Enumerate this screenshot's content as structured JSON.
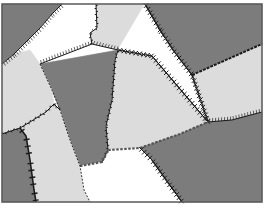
{
  "figure": {
    "title": "",
    "colors": {
      "dark": "#7c7c7c",
      "light": "#dcdcdc",
      "white": "#ffffff",
      "frame": "#5a5a5a",
      "boundary": "#1a1a1a"
    },
    "regions": [
      {
        "id": "r1",
        "shade": "dark",
        "points": "2,4 62,4 52,14 40,28 28,40 14,54 2,64"
      },
      {
        "id": "r2",
        "shade": "white",
        "points": "62,4 96,4 97,28 90,33 92,44 40,64 30,50 14,54 28,40 40,28 52,14"
      },
      {
        "id": "r3",
        "shade": "light",
        "points": "96,4 145,4 118,50 92,44 90,33 97,28"
      },
      {
        "id": "r4",
        "shade": "dark",
        "points": "145,4 262,4 262,44 192,75 173,50 160,30"
      },
      {
        "id": "r5",
        "shade": "white",
        "points": "145,4 160,30 173,50 192,75 208,122 152,56 118,50"
      },
      {
        "id": "r6",
        "shade": "light",
        "points": "262,44 262,112 232,120 208,122 192,75"
      },
      {
        "id": "r7",
        "shade": "dark",
        "points": "40,64 118,50 115,60 112,100 106,126 108,150 102,162 80,166 70,140 60,110 52,90"
      },
      {
        "id": "r8",
        "shade": "light",
        "points": "118,50 152,56 208,122 180,134 140,148 108,150 106,126 112,100 115,60"
      },
      {
        "id": "r9",
        "shade": "light",
        "points": "2,64 14,54 30,50 40,64 52,90 54,104 46,112 30,122 20,128 2,134"
      },
      {
        "id": "r10",
        "shade": "dark",
        "points": "2,134 20,128 26,136 30,160 34,190 36,202 2,202"
      },
      {
        "id": "r11",
        "shade": "light",
        "points": "20,128 30,122 46,112 54,104 60,110 70,140 80,166 84,190 90,202 36,202 34,190 30,160 26,136"
      },
      {
        "id": "r12",
        "shade": "white",
        "points": "80,166 102,162 108,150 140,148 152,160 166,180 182,202 90,202 84,190"
      },
      {
        "id": "r13",
        "shade": "dark",
        "points": "140,148 180,134 208,122 232,120 262,112 262,202 182,202 166,180 152,160"
      }
    ],
    "boundaries": [
      {
        "id": "b1",
        "style": "hatched",
        "points": "62,4 52,14 40,28 28,40 14,54 2,64"
      },
      {
        "id": "b2",
        "style": "serrated",
        "points": "96,4 97,28 90,33 92,44"
      },
      {
        "id": "b3",
        "style": "hatched",
        "points": "40,64 92,44 118,50"
      },
      {
        "id": "b4",
        "style": "cross",
        "points": "145,4 160,30 173,50 192,75 208,122"
      },
      {
        "id": "b5",
        "style": "dashed-dot",
        "points": "192,75 262,44"
      },
      {
        "id": "b6",
        "style": "cross",
        "points": "118,50 152,56 208,122"
      },
      {
        "id": "b7",
        "style": "serrated",
        "points": "118,50 115,60 112,100 106,126 108,150 102,162"
      },
      {
        "id": "b8",
        "style": "hatched",
        "points": "208,122 232,120 262,112"
      },
      {
        "id": "b9",
        "style": "dotted-box",
        "points": "80,166 102,162 108,150 140,148 180,134 208,122"
      },
      {
        "id": "b10",
        "style": "zigzag",
        "points": "2,134 20,128 30,122 46,112 54,104 60,110"
      },
      {
        "id": "b11",
        "style": "thick-burr",
        "points": "20,128 26,136 30,160 34,190 36,202"
      },
      {
        "id": "b12",
        "style": "dashed",
        "points": "40,64 52,90 60,110 70,140 80,166 84,190 90,202"
      },
      {
        "id": "b13",
        "style": "cross",
        "points": "140,148 152,160 166,180 182,202"
      }
    ],
    "frame": {
      "x": 2,
      "y": 4,
      "width": 260,
      "height": 198
    }
  }
}
